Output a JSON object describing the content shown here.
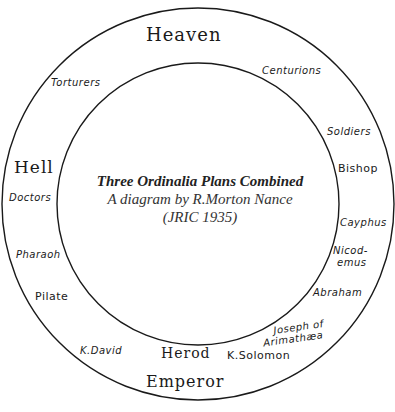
{
  "diagram": {
    "title": "Three Ordinalia Plans Combined",
    "subtitle": "A diagram by R.Morton Nance",
    "citation": "(JRIC 1935)",
    "stroke_color": "#1a1a1a",
    "background": "#ffffff",
    "circles": {
      "outer": {
        "cx": 198,
        "cy": 204,
        "r": 196
      },
      "inner": {
        "cx": 198,
        "cy": 204,
        "r": 141
      }
    },
    "regions": {
      "top": "Heaven",
      "left": "Hell",
      "bottom": "Emperor"
    },
    "stations": [
      {
        "id": "torturers",
        "label": "Torturers"
      },
      {
        "id": "centurions",
        "label": "Centurions"
      },
      {
        "id": "soldiers",
        "label": "Soldiers"
      },
      {
        "id": "bishop",
        "label": "Bishop"
      },
      {
        "id": "cayphus",
        "label": "Cayphus"
      },
      {
        "id": "nicodemus",
        "label_line1": "Nicod-",
        "label_line2": "emus"
      },
      {
        "id": "abraham",
        "label": "Abraham"
      },
      {
        "id": "joseph",
        "label_line1": "Joseph of",
        "label_line2": "Arimathæa"
      },
      {
        "id": "solomon",
        "label": "K.Solomon"
      },
      {
        "id": "herod",
        "label": "Herod"
      },
      {
        "id": "david",
        "label": "K.David"
      },
      {
        "id": "pilate",
        "label": "Pilate"
      },
      {
        "id": "pharaoh",
        "label": "Pharaoh"
      },
      {
        "id": "doctors",
        "label": "Doctors"
      }
    ]
  }
}
